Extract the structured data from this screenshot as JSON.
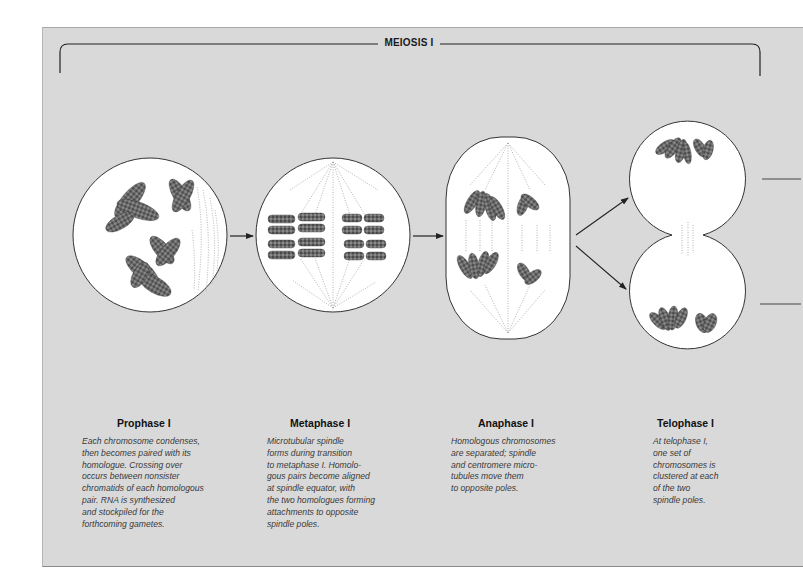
{
  "header": {
    "title": "MEIOSIS I"
  },
  "colors": {
    "panel_bg": "#d9d9d9",
    "cell_fill": "#ffffff",
    "outline": "#333333",
    "chromosome": "#5a5a5a",
    "spindle": "#9a9a9a"
  },
  "phases": [
    {
      "title": "Prophase I",
      "description": "Each chromosome condenses,\nthen becomes paired with its\nhomologue. Crossing over\noccurs between nonsister\nchromatids of each homologous\npair. RNA is synthesized\nand stockpiled for the\nforthcoming gametes."
    },
    {
      "title": "Metaphase I",
      "description": "Microtubular spindle\nforms during transition\nto metaphase I. Homolo-\ngous pairs become aligned\nat spindle equator, with\nthe two homologues forming\nattachments to opposite\nspindle poles."
    },
    {
      "title": "Anaphase I",
      "description": "Homologous chromosomes\nare separated; spindle\nand centromere micro-\ntubules move them\nto opposite poles."
    },
    {
      "title": "Telophase I",
      "description": "At telophase I,\none set of\nchromosomes is\nclustered at each\nof the two\nspindle poles."
    }
  ]
}
